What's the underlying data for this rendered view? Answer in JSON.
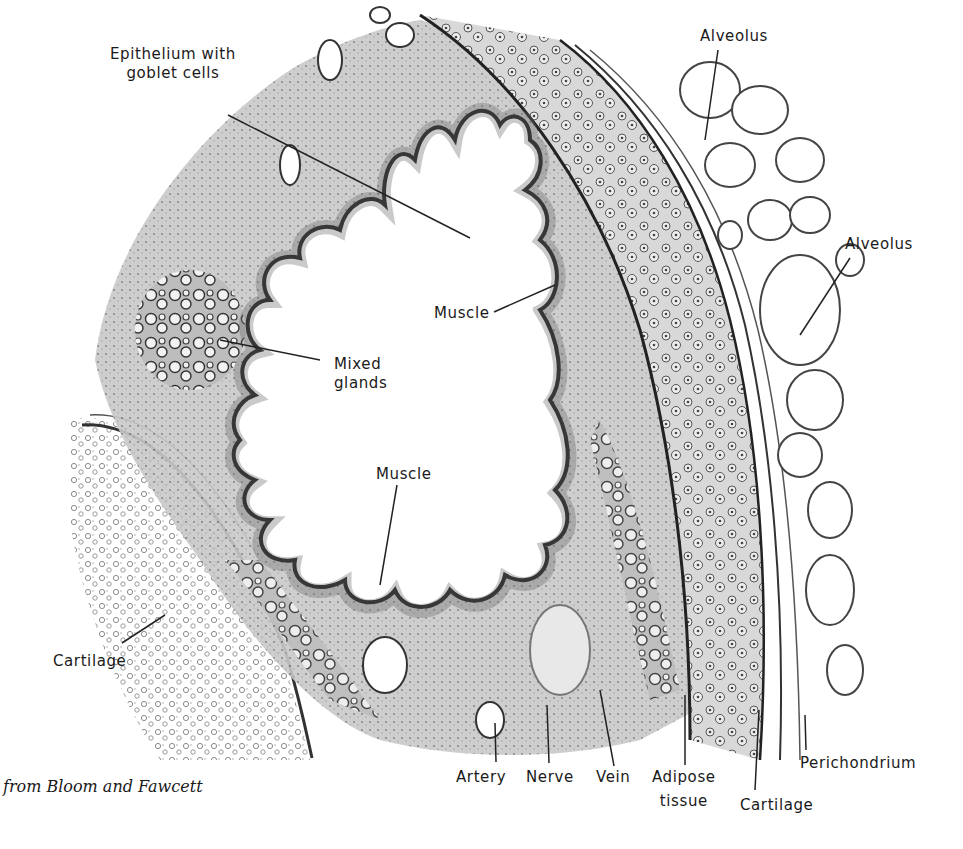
{
  "figure": {
    "credit": "from Bloom and Fawcett",
    "colors": {
      "ink": "#1a1a1a",
      "tissue": "#8a8a8a",
      "background": "#ffffff"
    },
    "labels": [
      {
        "id": "epithelium",
        "line1": "Epithelium with",
        "line2": "goblet cells"
      },
      {
        "id": "alveolus-top",
        "line1": "Alveolus"
      },
      {
        "id": "alveolus-right",
        "line1": "Alveolus"
      },
      {
        "id": "muscle-right",
        "line1": "Muscle"
      },
      {
        "id": "mixed-glands",
        "line1": "Mixed",
        "line2": "glands"
      },
      {
        "id": "muscle-bottom",
        "line1": "Muscle"
      },
      {
        "id": "cartilage-left",
        "line1": "Cartilage"
      },
      {
        "id": "artery",
        "line1": "Artery"
      },
      {
        "id": "nerve",
        "line1": "Nerve"
      },
      {
        "id": "vein",
        "line1": "Vein"
      },
      {
        "id": "adipose",
        "line1": "Adipose",
        "line2": "tissue"
      },
      {
        "id": "cartilage-bottom",
        "line1": "Cartilage"
      },
      {
        "id": "perichondrium",
        "line1": "Perichondrium"
      }
    ]
  }
}
